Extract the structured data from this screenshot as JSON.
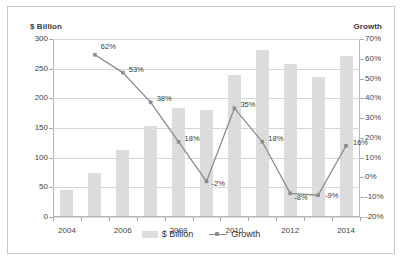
{
  "chart_data": {
    "type": "bar",
    "title": "",
    "subtitle": "",
    "xlabel": "",
    "ylabel": "$ Billion",
    "y2label": "Growth",
    "categories": [
      "2004",
      "2005",
      "2006",
      "2007",
      "2008",
      "2009",
      "2010",
      "2011",
      "2012",
      "2013",
      "2014"
    ],
    "x_tick_labels": [
      "2004",
      "2006",
      "2008",
      "2010",
      "2012",
      "2014"
    ],
    "grid": true,
    "legend_position": "bottom",
    "ylim": [
      0,
      300
    ],
    "y_ticks": [
      "0",
      "50",
      "100",
      "150",
      "200",
      "250",
      "300"
    ],
    "y2lim": [
      -20,
      70
    ],
    "y2_ticks": [
      "-20%",
      "-10%",
      "0%",
      "10%",
      "20%",
      "30%",
      "40%",
      "50%",
      "60%",
      "70%"
    ],
    "series": [
      {
        "name": "$ Billion",
        "type": "bar",
        "axis": "left",
        "color": "#DCDCDC",
        "values": [
          44,
          72,
          112,
          152,
          182,
          178,
          238,
          280,
          257,
          234,
          270
        ]
      },
      {
        "name": "Growth",
        "type": "line",
        "axis": "right",
        "color": "#8C8C8C",
        "values": [
          null,
          62,
          53,
          38,
          18,
          -2,
          35,
          18,
          -8,
          -9,
          16
        ],
        "point_labels": [
          "",
          "62%",
          "53%",
          "38%",
          "18%",
          "-2%",
          "35%",
          "18%",
          "-8%",
          "-9%",
          "16%"
        ]
      }
    ]
  },
  "legend": {
    "items": [
      {
        "label": "$ Billion",
        "icon": "bar-swatch"
      },
      {
        "label": "Growth",
        "icon": "line-marker-swatch"
      }
    ]
  },
  "axis_titles": {
    "left": "$ Billion",
    "right": "Growth"
  }
}
